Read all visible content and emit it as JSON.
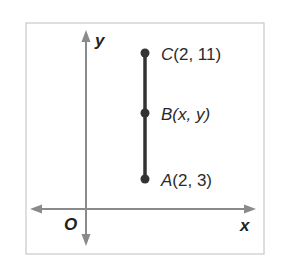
{
  "diagram": {
    "type": "coordinate-plane",
    "axes": {
      "x_label": "x",
      "y_label": "y",
      "origin_label": "O"
    },
    "segment": {
      "from": "A",
      "to": "C"
    },
    "points": [
      {
        "name": "C",
        "coords": "(2, 11)"
      },
      {
        "name": "B",
        "coords": "(x, y)"
      },
      {
        "name": "A",
        "coords": "(2, 3)"
      }
    ],
    "colors": {
      "axis": "#8a8a8a",
      "segment": "#333333",
      "frame": "#c8c8c8",
      "text": "#2a2a2a"
    }
  }
}
